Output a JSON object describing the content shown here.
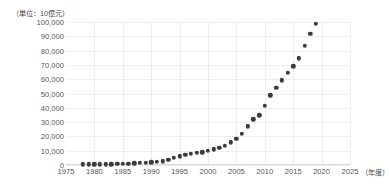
{
  "chart_data": {
    "type": "scatter",
    "title": "",
    "subtitle": "",
    "unit_caption": "（単位：10億元）",
    "xlabel": "（年度）",
    "ylabel": "",
    "xlim": [
      1975,
      2025
    ],
    "ylim": [
      0,
      100000
    ],
    "x_ticks": [
      1975,
      1980,
      1985,
      1990,
      1995,
      2000,
      2005,
      2010,
      2015,
      2020,
      2025
    ],
    "x_tick_labels": [
      "1975",
      "1980",
      "1985",
      "1990",
      "1995",
      "2000",
      "2005",
      "2010",
      "2015",
      "2020",
      "2025"
    ],
    "y_ticks": [
      0,
      10000,
      20000,
      30000,
      40000,
      50000,
      60000,
      70000,
      80000,
      90000,
      100000
    ],
    "y_tick_labels": [
      "0",
      "10,000",
      "20,000",
      "30,000",
      "40,000",
      "50,000",
      "60,000",
      "70,000",
      "80,000",
      "90,000",
      "100,000"
    ],
    "grid": true,
    "legend": false,
    "marker_color": "#3b3b3d",
    "grid_color": "#ededed",
    "background_color": "#ffffff",
    "series": [
      {
        "name": "",
        "x": [
          1978,
          1979,
          1980,
          1981,
          1982,
          1983,
          1984,
          1985,
          1986,
          1987,
          1988,
          1989,
          1990,
          1991,
          1992,
          1993,
          1994,
          1995,
          1996,
          1997,
          1998,
          1999,
          2000,
          2001,
          2002,
          2003,
          2004,
          2005,
          2006,
          2007,
          2008,
          2009,
          2010,
          2011,
          2012,
          2013,
          2014,
          2015,
          2016,
          2017,
          2018,
          2019
        ],
        "values": [
          365,
          406,
          459,
          489,
          532,
          597,
          721,
          901,
          1028,
          1214,
          1504,
          1700,
          1867,
          2178,
          2692,
          3533,
          4820,
          6079,
          7118,
          7897,
          8440,
          8968,
          9921,
          10966,
          12033,
          13582,
          15988,
          18493,
          21944,
          27009,
          31924,
          34852,
          41211,
          48794,
          53858,
          59296,
          64356,
          68886,
          74640,
          83204,
          91928,
          98651
        ]
      }
    ]
  }
}
